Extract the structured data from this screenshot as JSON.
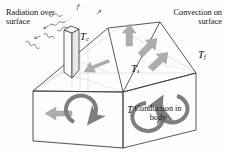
{
  "figure": {
    "type": "heat-transfer-house-diagram",
    "background_color": "#fdfdfd",
    "line_color": "#3c3c3c",
    "arrow_color": "#adadad",
    "loop_color": "#7e7e7e",
    "text_color": "#141414"
  },
  "labels": {
    "radiation": "Radiation over\nsurface",
    "convection": "Convection on\nsurface",
    "conduction": "Conduction in\nbody"
  },
  "symbols": {
    "ambient": {
      "base": "T",
      "sub": "c"
    },
    "fluid": {
      "base": "T",
      "sub": "f"
    },
    "surface": {
      "base": "T",
      "sub": "s"
    },
    "body": {
      "base": "T",
      "sub": ""
    }
  },
  "annotations": {
    "radiation_wave_count": 5,
    "roof_arrow_count": 3,
    "wall_arrow_count": 1,
    "loop_count": 3,
    "chimney": "chimney"
  }
}
